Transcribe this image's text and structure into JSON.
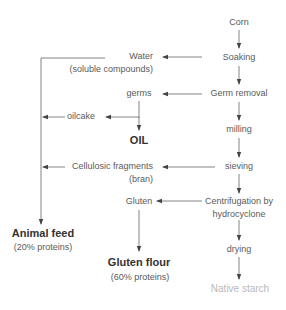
{
  "diagram": {
    "main_chain": {
      "corn": "Corn",
      "soaking": "Soaking",
      "germ_removal": "Germ removal",
      "milling": "milling",
      "sieving": "sieving",
      "centrifugation_line1": "Centrifugation by",
      "centrifugation_line2": "hydrocyclone",
      "drying": "drying",
      "native_starch": "Native starch"
    },
    "byproducts": {
      "water_line1": "Water",
      "water_line2": "(soluble compounds)",
      "germs": "germs",
      "oilcake": "oilcake",
      "oil": "OIL",
      "cellulosic_line1": "Cellulosic fragments",
      "cellulosic_line2": "(bran)",
      "gluten": "Gluten"
    },
    "outputs": {
      "animal_feed": "Animal feed",
      "animal_feed_note": "(20% proteins)",
      "gluten_flour": "Gluten flour",
      "gluten_flour_note": "(60% proteins)"
    },
    "colors": {
      "line": "#555555",
      "text": "#5a5a5a",
      "bold_text": "#333333",
      "native_starch": "#b8b8b8"
    }
  }
}
